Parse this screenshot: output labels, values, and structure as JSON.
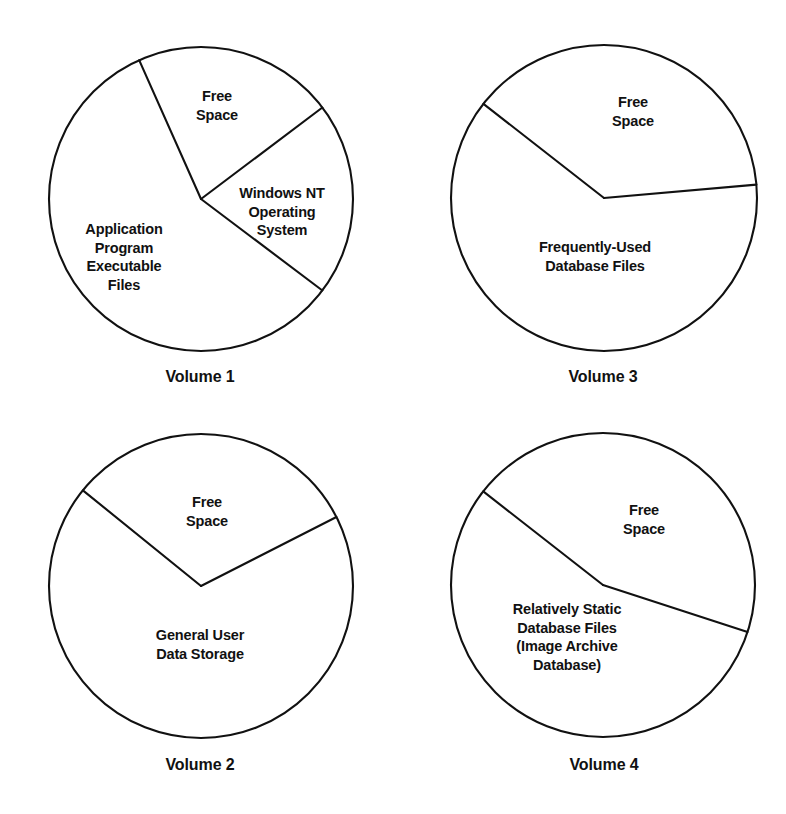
{
  "figure": {
    "background_color": "#ffffff",
    "line_color": "#111111",
    "text_color": "#111111"
  },
  "chart_data": [
    {
      "type": "pie",
      "title": "Volume 1",
      "grid": false,
      "legend": "none",
      "labels_position": "inside-slice",
      "center": [
        201,
        199
      ],
      "radius": 152,
      "categories": [
        "Free Space",
        "Application Program Executable Files",
        "Windows NT Operating System"
      ],
      "values": [
        21.5,
        58.0,
        20.5
      ],
      "units": "percent of volume",
      "slices": [
        {
          "label": "Free\nSpace",
          "value": 21.5,
          "start_angle_deg": 37,
          "end_angle_deg": 114,
          "label_x": 217,
          "label_y": 106
        },
        {
          "label": "Application\nProgram\nExecutable\nFiles",
          "value": 58.0,
          "start_angle_deg": 114,
          "end_angle_deg": 323,
          "label_x": 124,
          "label_y": 257
        },
        {
          "label": "Windows NT\nOperating\nSystem",
          "value": 20.5,
          "start_angle_deg": 323,
          "end_angle_deg": 37,
          "label_x": 282,
          "label_y": 212
        }
      ],
      "caption_x": 200,
      "caption_y": 377
    },
    {
      "type": "pie",
      "title": "Volume 3",
      "grid": false,
      "legend": "none",
      "labels_position": "inside-slice",
      "center": [
        604,
        198
      ],
      "radius": 153,
      "categories": [
        "Free Space",
        "Frequently-Used Database Files"
      ],
      "values": [
        38.0,
        62.0
      ],
      "units": "percent of volume",
      "slices": [
        {
          "label": "Free\nSpace",
          "value": 38.0,
          "start_angle_deg": 5,
          "end_angle_deg": 142,
          "label_x": 633,
          "label_y": 112
        },
        {
          "label": "Frequently-Used\nDatabase Files",
          "value": 62.0,
          "start_angle_deg": 142,
          "end_angle_deg": 5,
          "label_x": 595,
          "label_y": 257
        }
      ],
      "caption_x": 603,
      "caption_y": 377
    },
    {
      "type": "pie",
      "title": "Volume 2",
      "grid": false,
      "legend": "none",
      "labels_position": "inside-slice",
      "center": [
        201,
        586
      ],
      "radius": 152,
      "categories": [
        "Free Space",
        "General User Data Storage"
      ],
      "values": [
        31.5,
        68.5
      ],
      "units": "percent of volume",
      "slices": [
        {
          "label": "Free\nSpace",
          "value": 31.5,
          "start_angle_deg": 27,
          "end_angle_deg": 141,
          "label_x": 207,
          "label_y": 512
        },
        {
          "label": "General User\nData Storage",
          "value": 68.5,
          "start_angle_deg": 141,
          "end_angle_deg": 27,
          "label_x": 200,
          "label_y": 645
        }
      ],
      "caption_x": 200,
      "caption_y": 765
    },
    {
      "type": "pie",
      "title": "Volume 4",
      "grid": false,
      "legend": "none",
      "labels_position": "inside-slice",
      "center": [
        603,
        585
      ],
      "radius": 152,
      "categories": [
        "Free Space",
        "Relatively Static Database Files (Image Archive Database)"
      ],
      "values": [
        44.5,
        55.5
      ],
      "units": "percent of volume",
      "slices": [
        {
          "label": "Free\nSpace",
          "value": 44.5,
          "start_angle_deg": -18,
          "end_angle_deg": 142,
          "label_x": 644,
          "label_y": 520
        },
        {
          "label": "Relatively Static\nDatabase Files\n(Image Archive\nDatabase)",
          "value": 55.5,
          "start_angle_deg": 142,
          "end_angle_deg": -18,
          "label_x": 567,
          "label_y": 637
        }
      ],
      "caption_x": 604,
      "caption_y": 765
    }
  ]
}
